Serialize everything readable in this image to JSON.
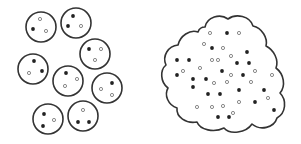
{
  "colors": {
    "outline": "#333333",
    "filled_dot": "#222222",
    "hollow_dot_stroke": "#8a8a8a",
    "hollow_dot_fill": "#ffffff",
    "background": "#ffffff"
  },
  "left_group": {
    "label": "separate-particles",
    "circle_radius": 15,
    "circles": [
      {
        "cx": 41,
        "cy": 27,
        "dots": [
          {
            "x": 40,
            "y": 19,
            "type": "hollow"
          },
          {
            "x": 33,
            "y": 29,
            "type": "filled"
          },
          {
            "x": 46,
            "y": 31,
            "type": "hollow"
          }
        ]
      },
      {
        "cx": 76,
        "cy": 23,
        "dots": [
          {
            "x": 73,
            "y": 16,
            "type": "filled"
          },
          {
            "x": 68,
            "y": 26,
            "type": "filled"
          },
          {
            "x": 81,
            "y": 26,
            "type": "hollow"
          }
        ]
      },
      {
        "cx": 95,
        "cy": 54,
        "dots": [
          {
            "x": 89,
            "y": 49,
            "type": "filled"
          },
          {
            "x": 101,
            "y": 49,
            "type": "hollow"
          },
          {
            "x": 95,
            "y": 60,
            "type": "hollow"
          }
        ]
      },
      {
        "cx": 33,
        "cy": 69,
        "dots": [
          {
            "x": 34,
            "y": 61,
            "type": "filled"
          },
          {
            "x": 29,
            "y": 73,
            "type": "hollow"
          },
          {
            "x": 42,
            "y": 71,
            "type": "filled"
          }
        ]
      },
      {
        "cx": 68,
        "cy": 81,
        "dots": [
          {
            "x": 66,
            "y": 73,
            "type": "filled"
          },
          {
            "x": 77,
            "y": 79,
            "type": "hollow"
          },
          {
            "x": 65,
            "y": 86,
            "type": "hollow"
          }
        ]
      },
      {
        "cx": 107,
        "cy": 88,
        "dots": [
          {
            "x": 112,
            "y": 83,
            "type": "filled"
          },
          {
            "x": 101,
            "y": 89,
            "type": "hollow"
          },
          {
            "x": 112,
            "y": 95,
            "type": "hollow"
          }
        ]
      },
      {
        "cx": 48,
        "cy": 119,
        "dots": [
          {
            "x": 44,
            "y": 114,
            "type": "filled"
          },
          {
            "x": 54,
            "y": 120,
            "type": "hollow"
          },
          {
            "x": 43,
            "y": 126,
            "type": "filled"
          }
        ]
      },
      {
        "cx": 83,
        "cy": 116,
        "dots": [
          {
            "x": 83,
            "y": 110,
            "type": "hollow"
          },
          {
            "x": 78,
            "y": 122,
            "type": "filled"
          },
          {
            "x": 89,
            "y": 122,
            "type": "filled"
          }
        ]
      }
    ]
  },
  "right_group": {
    "label": "merged-cloud",
    "dots": [
      {
        "x": 210,
        "y": 33,
        "type": "hollow"
      },
      {
        "x": 227,
        "y": 33,
        "type": "filled"
      },
      {
        "x": 239,
        "y": 33,
        "type": "hollow"
      },
      {
        "x": 204,
        "y": 44,
        "type": "hollow"
      },
      {
        "x": 212,
        "y": 48,
        "type": "filled"
      },
      {
        "x": 223,
        "y": 48,
        "type": "hollow"
      },
      {
        "x": 247,
        "y": 52,
        "type": "filled"
      },
      {
        "x": 231,
        "y": 56,
        "type": "hollow"
      },
      {
        "x": 177,
        "y": 60,
        "type": "filled"
      },
      {
        "x": 189,
        "y": 60,
        "type": "filled"
      },
      {
        "x": 212,
        "y": 60,
        "type": "hollow"
      },
      {
        "x": 218,
        "y": 60,
        "type": "hollow"
      },
      {
        "x": 237,
        "y": 63,
        "type": "filled"
      },
      {
        "x": 249,
        "y": 63,
        "type": "filled"
      },
      {
        "x": 200,
        "y": 68,
        "type": "hollow"
      },
      {
        "x": 183,
        "y": 71,
        "type": "hollow"
      },
      {
        "x": 222,
        "y": 71,
        "type": "filled"
      },
      {
        "x": 255,
        "y": 71,
        "type": "hollow"
      },
      {
        "x": 177,
        "y": 75,
        "type": "filled"
      },
      {
        "x": 231,
        "y": 75,
        "type": "hollow"
      },
      {
        "x": 243,
        "y": 75,
        "type": "filled"
      },
      {
        "x": 272,
        "y": 75,
        "type": "hollow"
      },
      {
        "x": 193,
        "y": 79,
        "type": "filled"
      },
      {
        "x": 206,
        "y": 79,
        "type": "filled"
      },
      {
        "x": 214,
        "y": 83,
        "type": "hollow"
      },
      {
        "x": 227,
        "y": 82,
        "type": "hollow"
      },
      {
        "x": 251,
        "y": 82,
        "type": "hollow"
      },
      {
        "x": 193,
        "y": 87,
        "type": "filled"
      },
      {
        "x": 239,
        "y": 90,
        "type": "filled"
      },
      {
        "x": 264,
        "y": 90,
        "type": "filled"
      },
      {
        "x": 208,
        "y": 94,
        "type": "filled"
      },
      {
        "x": 220,
        "y": 94,
        "type": "filled"
      },
      {
        "x": 268,
        "y": 98,
        "type": "hollow"
      },
      {
        "x": 239,
        "y": 102,
        "type": "hollow"
      },
      {
        "x": 255,
        "y": 102,
        "type": "filled"
      },
      {
        "x": 197,
        "y": 107,
        "type": "hollow"
      },
      {
        "x": 212,
        "y": 107,
        "type": "hollow"
      },
      {
        "x": 223,
        "y": 106,
        "type": "hollow"
      },
      {
        "x": 274,
        "y": 110,
        "type": "filled"
      },
      {
        "x": 233,
        "y": 113,
        "type": "hollow"
      },
      {
        "x": 218,
        "y": 117,
        "type": "filled"
      },
      {
        "x": 229,
        "y": 117,
        "type": "filled"
      }
    ]
  }
}
